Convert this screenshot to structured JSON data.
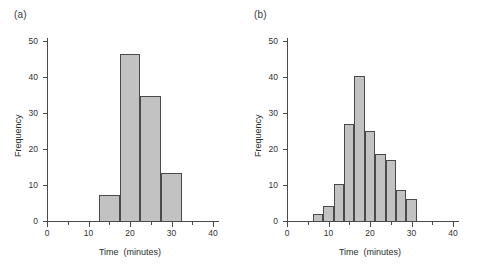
{
  "figure": {
    "background": "#ffffff",
    "bar_fill": "#c2c2c2",
    "bar_stroke": "#4a4a4a",
    "axis_color": "#4a4a4a"
  },
  "panels": [
    {
      "label": "(a)",
      "chart_data": {
        "type": "bar",
        "title": "",
        "xlabel": "Time  (minutes)",
        "ylabel": "Frequency",
        "xlim": [
          0,
          40
        ],
        "ylim": [
          0,
          50
        ],
        "xticks": [
          0,
          10,
          20,
          30,
          40
        ],
        "xtick_labels": [
          "0",
          "10",
          "20",
          "30",
          "40"
        ],
        "yticks": [
          0,
          10,
          20,
          30,
          40,
          50
        ],
        "ytick_labels": [
          "0",
          "10",
          "20",
          "30",
          "40",
          "50"
        ],
        "grid": false,
        "legend": "none",
        "bin_width": 5,
        "bins": [
          {
            "start": 12.5,
            "end": 17.5,
            "value": 7.3
          },
          {
            "start": 17.5,
            "end": 22.5,
            "value": 46.5
          },
          {
            "start": 22.5,
            "end": 27.5,
            "value": 34.8
          },
          {
            "start": 27.5,
            "end": 32.5,
            "value": 13.2
          }
        ]
      }
    },
    {
      "label": "(b)",
      "chart_data": {
        "type": "bar",
        "title": "",
        "xlabel": "Time  (minutes)",
        "ylabel": "Frequency",
        "xlim": [
          0,
          40
        ],
        "ylim": [
          0,
          50
        ],
        "xticks": [
          0,
          10,
          20,
          30,
          40
        ],
        "xtick_labels": [
          "0",
          "10",
          "20",
          "30",
          "40"
        ],
        "yticks": [
          0,
          10,
          20,
          30,
          40,
          50
        ],
        "ytick_labels": [
          "0",
          "10",
          "20",
          "30",
          "40",
          "50"
        ],
        "grid": false,
        "legend": "none",
        "bin_width": 2.5,
        "bins": [
          {
            "start": 6.25,
            "end": 8.75,
            "value": 2.0
          },
          {
            "start": 8.75,
            "end": 11.25,
            "value": 4.3
          },
          {
            "start": 11.25,
            "end": 13.75,
            "value": 10.2
          },
          {
            "start": 13.75,
            "end": 16.25,
            "value": 27.0
          },
          {
            "start": 16.25,
            "end": 18.75,
            "value": 40.2
          },
          {
            "start": 18.75,
            "end": 21.25,
            "value": 25.0
          },
          {
            "start": 21.25,
            "end": 23.75,
            "value": 18.5
          },
          {
            "start": 23.75,
            "end": 26.25,
            "value": 17.0
          },
          {
            "start": 26.25,
            "end": 28.75,
            "value": 8.5
          },
          {
            "start": 28.75,
            "end": 31.25,
            "value": 6.0
          }
        ]
      }
    }
  ]
}
